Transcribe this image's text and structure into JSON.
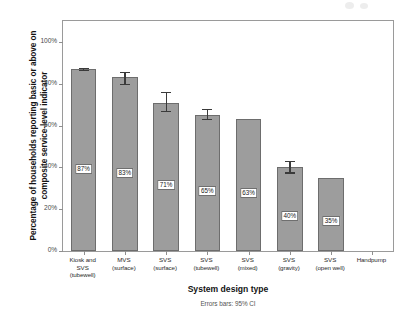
{
  "chart_data": {
    "type": "bar",
    "title": "",
    "xlabel": "System design type",
    "ylabel": "Percentage of households reporting basic or above on composite service-level indicator",
    "footnote": "Errors bars: 95% CI",
    "ylim": [
      0,
      110
    ],
    "ytick_values": [
      0,
      20,
      40,
      60,
      80,
      100
    ],
    "ytick_labels": [
      "0%",
      "20%",
      "40%",
      "60%",
      "80%",
      "100%"
    ],
    "grid": false,
    "legend": "none",
    "bar_color": "#9d9d9d",
    "bar_edge_color": "#6d6d6d",
    "error_bar_color": "#3a3a3a",
    "categories": [
      "Kiosk and SVS (tubewell)",
      "MVS (surface)",
      "SVS (surface)",
      "SVS (tubewell)",
      "SVS (mixed)",
      "SVS (gravity)",
      "SVS (open well)",
      "Handpump"
    ],
    "category_lines": [
      [
        "Kiosk and",
        "SVS",
        "(tubewell)"
      ],
      [
        "MVS",
        "(surface)"
      ],
      [
        "SVS",
        "(surface)"
      ],
      [
        "SVS",
        "(tubewell)"
      ],
      [
        "SVS",
        "(mixed)"
      ],
      [
        "SVS",
        "(gravity)"
      ],
      [
        "SVS",
        "(open well)"
      ],
      [
        "Handpump"
      ]
    ],
    "values": [
      87,
      83,
      71,
      65,
      63,
      40,
      35,
      null
    ],
    "value_labels": [
      "87%",
      "83%",
      "71%",
      "65%",
      "63%",
      "40%",
      "35%",
      ""
    ],
    "ci_low": [
      86,
      79.5,
      66.5,
      62.5,
      63,
      37,
      35,
      null
    ],
    "ci_high": [
      87.5,
      85.5,
      76,
      68,
      63,
      43,
      35,
      null
    ],
    "has_error_bar": [
      true,
      true,
      true,
      true,
      false,
      true,
      false,
      false
    ]
  }
}
